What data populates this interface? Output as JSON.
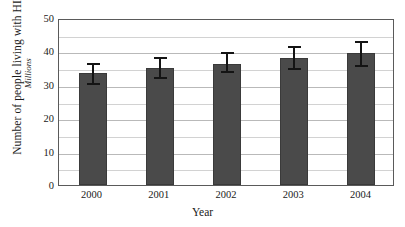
{
  "chart_data": {
    "type": "bar",
    "title": "",
    "xlabel": "Year",
    "ylabel": "Number of people living with HIV",
    "ylabel_units": "Millions",
    "categories": [
      "2000",
      "2001",
      "2002",
      "2003",
      "2004"
    ],
    "values": [
      33.5,
      35.0,
      36.3,
      37.9,
      39.4
    ],
    "error_low": [
      30.5,
      32.3,
      34.0,
      35.0,
      35.8
    ],
    "error_high": [
      37.0,
      38.8,
      40.3,
      42.2,
      43.8
    ],
    "ylim": [
      0,
      50
    ],
    "ytick_values": [
      0,
      10,
      20,
      30,
      40,
      50
    ],
    "ytick_labels": [
      "0",
      "10",
      "20",
      "30",
      "40",
      "50"
    ],
    "minor_tick_step": 5,
    "grid": true,
    "grid_axis": "y",
    "legend": false,
    "bar_color": "#4a4a4a",
    "grid_color": "#c6c6c6",
    "axis_color": "#5a5a5a",
    "error_bar_color": "#141414"
  }
}
